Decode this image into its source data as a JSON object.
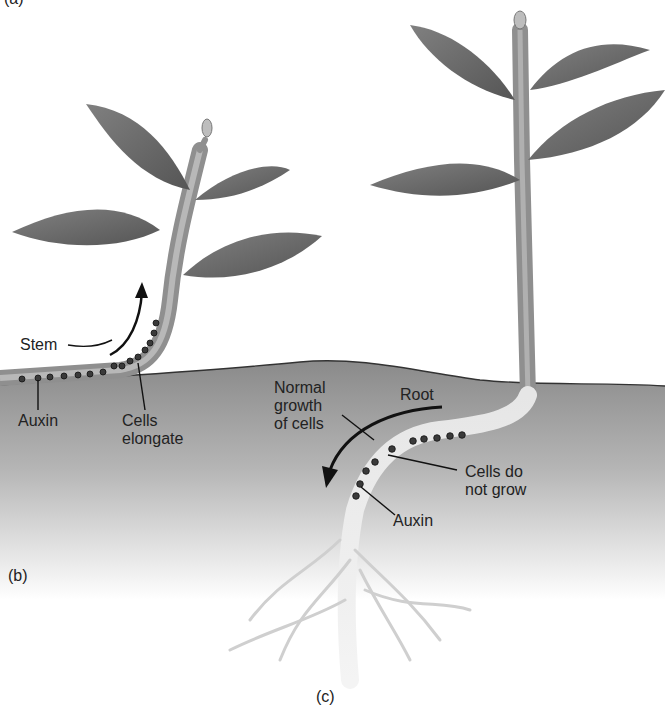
{
  "panel_labels": {
    "a": "(a)",
    "b": "(b)",
    "c": "(c)"
  },
  "left_plant": {
    "stem_label": "Stem",
    "auxin_label": "Auxin",
    "cells_label_line1": "Cells",
    "cells_label_line2": "elongate"
  },
  "right_plant": {
    "root_label": "Root",
    "normal_line1": "Normal",
    "normal_line2": "growth",
    "normal_line3": "of cells",
    "cells_line1": "Cells do",
    "cells_line2": "not grow",
    "auxin_label": "Auxin"
  },
  "colors": {
    "soil_top": "#8f8f8f",
    "soil_bottom": "#ffffff",
    "leaf": "#6e6e6e",
    "stem": "#9a9a9a",
    "root": "#d8d8d8",
    "auxin_dot": "#3a3a3a"
  }
}
